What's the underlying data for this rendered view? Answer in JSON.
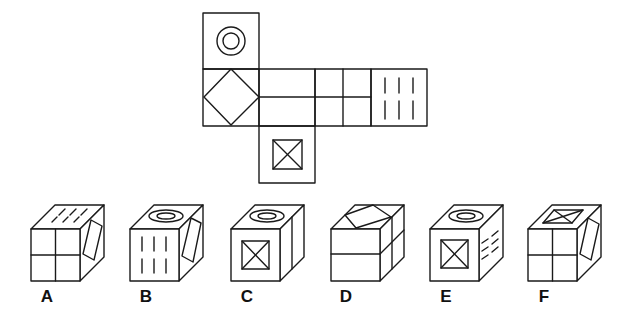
{
  "colors": {
    "line": "#1a1a1a",
    "background": "#ffffff"
  },
  "net": {
    "faces": [
      {
        "id": "top",
        "symbol": "concentric-circles"
      },
      {
        "id": "left",
        "symbol": "diamond"
      },
      {
        "id": "center-1",
        "symbol": "horizontal-split"
      },
      {
        "id": "center-2",
        "symbol": "four-quadrant-grid"
      },
      {
        "id": "right",
        "symbol": "six-vertical-dashes"
      },
      {
        "id": "bottom",
        "symbol": "square-with-x"
      }
    ]
  },
  "options": [
    {
      "label": "A",
      "front": "four-quadrant-grid",
      "top": "dashes",
      "side": "diamond"
    },
    {
      "label": "B",
      "front": "six-vertical-dashes",
      "top": "concentric-circles",
      "side": "diamond"
    },
    {
      "label": "C",
      "front": "square-with-x",
      "top": "concentric-circles",
      "side": "vertical-split"
    },
    {
      "label": "D",
      "front": "horizontal-split",
      "top": "diamond",
      "side": "horizontal-split"
    },
    {
      "label": "E",
      "front": "square-with-x",
      "top": "concentric-circles",
      "side": "dashes"
    },
    {
      "label": "F",
      "front": "four-quadrant-grid",
      "top": "square-with-x",
      "side": "diamond"
    }
  ]
}
